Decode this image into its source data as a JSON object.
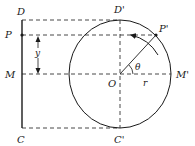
{
  "diagram": {
    "labels": {
      "D": "D",
      "P": "P",
      "M": "M",
      "C": "C",
      "D_prime": "D'",
      "P_prime": "P'",
      "M_prime": "M'",
      "C_prime": "C'",
      "O": "O",
      "theta": "θ",
      "r": "r",
      "y": "y"
    },
    "colors": {
      "stroke": "#1a1a1a",
      "background": "#ffffff"
    }
  }
}
